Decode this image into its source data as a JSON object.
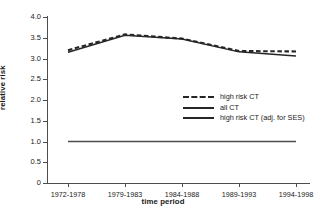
{
  "chart_data": {
    "type": "line",
    "title": "",
    "xlabel": "time period",
    "ylabel": "relative risk",
    "categories": [
      "1972-1978",
      "1979-1983",
      "1984-1988",
      "1989-1993",
      "1994-1998"
    ],
    "ylim": [
      0,
      4.0
    ],
    "yticks": [
      0,
      0.5,
      1.0,
      1.5,
      2.0,
      2.5,
      3.0,
      3.5,
      4.0
    ],
    "ytick_labels": [
      "0",
      "0.5",
      "1.0",
      "1.5",
      "2.0",
      "2.5",
      "3.0",
      "3.5",
      "4.0"
    ],
    "grid": false,
    "legend_position": "center-right",
    "series": [
      {
        "name": "high risk CT",
        "style": "dashed",
        "color": "#262626",
        "values": [
          3.2,
          3.58,
          3.48,
          3.18,
          3.17
        ]
      },
      {
        "name": "all CT",
        "style": "solid",
        "color": "#4d4d4d",
        "values": [
          1.0,
          1.0,
          1.0,
          1.0,
          1.0
        ]
      },
      {
        "name": "high risk CT (adj. for SES)",
        "style": "solid",
        "color": "#262626",
        "values": [
          3.15,
          3.56,
          3.47,
          3.16,
          3.06
        ]
      }
    ]
  },
  "legend": {
    "items": [
      {
        "label": "high risk CT"
      },
      {
        "label": "all CT"
      },
      {
        "label": "high risk CT (adj. for SES)"
      }
    ]
  }
}
